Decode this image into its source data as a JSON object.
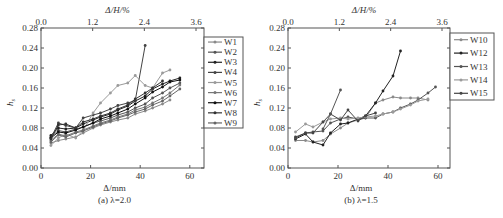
{
  "chart_data": [
    {
      "type": "line",
      "caption": "(a) λ=2.0",
      "xlabel": "Δ/mm",
      "ylabel": "h_s",
      "top_xlabel": "Δ/H/%",
      "xlim": [
        0,
        66
      ],
      "ylim": [
        0,
        0.28
      ],
      "xticks": [
        "0",
        "20",
        "40",
        "60"
      ],
      "top_xticks": [
        "0.0",
        "1.2",
        "2.4",
        "3.6"
      ],
      "yticks": [
        "0.00",
        "0.04",
        "0.08",
        "0.12",
        "0.16",
        "0.20",
        "0.24",
        "0.28"
      ],
      "legend_position": "right-outside",
      "series": [
        {
          "name": "W1",
          "color": "#8a8a8a",
          "x": [
            4,
            7,
            10,
            14,
            17,
            21,
            24,
            28,
            31,
            35,
            38,
            42,
            45,
            49,
            52
          ],
          "y": [
            0.05,
            0.055,
            0.058,
            0.062,
            0.07,
            0.08,
            0.086,
            0.092,
            0.096,
            0.1,
            0.108,
            0.114,
            0.12,
            0.128,
            0.136
          ]
        },
        {
          "name": "W2",
          "color": "#555555",
          "x": [
            4,
            7,
            10,
            14,
            17,
            21,
            24,
            28,
            31,
            35,
            38,
            42,
            45,
            49,
            52,
            56
          ],
          "y": [
            0.062,
            0.075,
            0.072,
            0.078,
            0.082,
            0.09,
            0.094,
            0.1,
            0.106,
            0.112,
            0.12,
            0.128,
            0.14,
            0.15,
            0.16,
            0.17
          ]
        },
        {
          "name": "W3",
          "color": "#222222",
          "x": [
            4,
            7,
            10,
            14,
            17,
            21,
            24,
            28,
            31,
            35,
            38,
            42,
            45,
            49,
            52,
            56
          ],
          "y": [
            0.065,
            0.08,
            0.078,
            0.08,
            0.088,
            0.096,
            0.102,
            0.108,
            0.116,
            0.124,
            0.134,
            0.144,
            0.158,
            0.168,
            0.174,
            0.18
          ]
        },
        {
          "name": "W4",
          "color": "#444444",
          "x": [
            4,
            7,
            10,
            14,
            17,
            21,
            24,
            28,
            31,
            35,
            38,
            42
          ],
          "y": [
            0.06,
            0.09,
            0.085,
            0.08,
            0.1,
            0.106,
            0.11,
            0.118,
            0.125,
            0.13,
            0.135,
            0.245
          ]
        },
        {
          "name": "W5",
          "color": "#9a9a9a",
          "x": [
            4,
            7,
            10,
            14,
            17,
            21,
            24,
            28,
            31,
            35,
            38,
            42,
            45,
            49,
            52
          ],
          "y": [
            0.045,
            0.06,
            0.068,
            0.06,
            0.075,
            0.11,
            0.13,
            0.15,
            0.165,
            0.17,
            0.185,
            0.165,
            0.16,
            0.19,
            0.196
          ]
        },
        {
          "name": "W6",
          "color": "#777777",
          "x": [
            4,
            7,
            10,
            14,
            17,
            21,
            24,
            28,
            31,
            35,
            38,
            42,
            45,
            49,
            52,
            56
          ],
          "y": [
            0.055,
            0.068,
            0.064,
            0.072,
            0.076,
            0.084,
            0.09,
            0.096,
            0.102,
            0.108,
            0.116,
            0.122,
            0.13,
            0.14,
            0.15,
            0.166
          ]
        },
        {
          "name": "W7",
          "color": "#111111",
          "x": [
            4,
            7,
            10,
            14,
            17,
            21,
            24,
            28,
            31,
            35,
            38,
            42,
            45,
            49,
            52,
            56
          ],
          "y": [
            0.06,
            0.072,
            0.07,
            0.076,
            0.082,
            0.09,
            0.098,
            0.104,
            0.11,
            0.118,
            0.128,
            0.14,
            0.152,
            0.162,
            0.172,
            0.176
          ]
        },
        {
          "name": "W8",
          "color": "#333333",
          "x": [
            4,
            7,
            10,
            14,
            17,
            21,
            24,
            28,
            31,
            35,
            38,
            42,
            45,
            49
          ],
          "y": [
            0.058,
            0.086,
            0.088,
            0.08,
            0.092,
            0.098,
            0.104,
            0.11,
            0.118,
            0.126,
            0.138,
            0.15,
            0.16,
            0.174
          ]
        },
        {
          "name": "W9",
          "color": "#666666",
          "x": [
            4,
            7,
            10,
            14,
            17,
            21,
            24,
            28,
            31,
            35,
            38,
            42,
            45,
            49,
            52,
            56
          ],
          "y": [
            0.052,
            0.066,
            0.062,
            0.07,
            0.074,
            0.082,
            0.088,
            0.094,
            0.1,
            0.106,
            0.112,
            0.118,
            0.126,
            0.134,
            0.144,
            0.158
          ]
        }
      ]
    },
    {
      "type": "line",
      "caption": "(b) λ=1.5",
      "xlabel": "Δ/mm",
      "ylabel": "h_s",
      "top_xlabel": "Δ/H/%",
      "xlim": [
        0,
        65
      ],
      "ylim": [
        0,
        0.28
      ],
      "xticks": [
        "0",
        "20",
        "40",
        "60"
      ],
      "top_xticks": [
        "0.0",
        "1.2",
        "2.4",
        "3.6"
      ],
      "yticks": [
        "0.00",
        "0.04",
        "0.08",
        "0.12",
        "0.16",
        "0.20",
        "0.24",
        "0.28"
      ],
      "legend_position": "right-outside",
      "series": [
        {
          "name": "W10",
          "color": "#8a8a8a",
          "x": [
            3,
            7,
            10,
            14,
            17,
            21,
            24,
            28,
            31,
            35,
            38,
            42,
            45,
            49,
            52,
            56
          ],
          "y": [
            0.055,
            0.055,
            0.052,
            0.055,
            0.068,
            0.08,
            0.09,
            0.096,
            0.1,
            0.13,
            0.136,
            0.142,
            0.14,
            0.14,
            0.14,
            0.136
          ]
        },
        {
          "name": "W12",
          "color": "#222222",
          "x": [
            3,
            7,
            10,
            14,
            17,
            21,
            24,
            28,
            31,
            35,
            38,
            42,
            45
          ],
          "y": [
            0.058,
            0.068,
            0.052,
            0.046,
            0.07,
            0.088,
            0.09,
            0.098,
            0.104,
            0.13,
            0.154,
            0.184,
            0.234
          ]
        },
        {
          "name": "W13",
          "color": "#555555",
          "x": [
            3,
            7,
            10,
            14,
            17,
            21,
            24,
            28,
            31,
            35,
            38,
            42,
            45,
            49,
            52,
            56,
            59
          ],
          "y": [
            0.06,
            0.07,
            0.072,
            0.074,
            0.09,
            0.098,
            0.102,
            0.098,
            0.1,
            0.1,
            0.108,
            0.112,
            0.12,
            0.128,
            0.136,
            0.15,
            0.162
          ]
        },
        {
          "name": "W14",
          "color": "#9a9a9a",
          "x": [
            3,
            7,
            10,
            14,
            17,
            21,
            24,
            28,
            31,
            35,
            38,
            42,
            45,
            49,
            52,
            56
          ],
          "y": [
            0.072,
            0.088,
            0.082,
            0.092,
            0.098,
            0.1,
            0.098,
            0.1,
            0.102,
            0.104,
            0.108,
            0.112,
            0.118,
            0.126,
            0.134,
            0.138
          ]
        },
        {
          "name": "W15",
          "color": "#444444",
          "x": [
            3,
            7,
            10,
            14,
            17,
            21,
            24,
            28,
            31,
            35
          ],
          "y": [
            0.062,
            0.07,
            0.07,
            0.092,
            0.108,
            0.096,
            0.116,
            0.094,
            0.104,
            0.11
          ]
        },
        {
          "name": "W15b",
          "hidden_legend": true,
          "color": "#555555",
          "x": [
            14,
            17,
            21
          ],
          "y": [
            0.078,
            0.108,
            0.156
          ]
        }
      ]
    }
  ]
}
